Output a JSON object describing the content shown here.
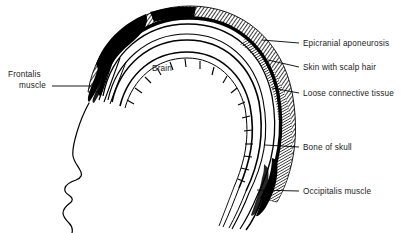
{
  "figure": {
    "background_color": "#ffffff",
    "ink_color": "#000000"
  },
  "interior_labels": [
    {
      "id": "brain",
      "text": "Brain",
      "x": 152,
      "y": 64
    }
  ],
  "labels_right": [
    {
      "id": "epicranial-aponeurosis",
      "text": "Epicranial aponeurosis",
      "text_x": 303,
      "text_y": 39,
      "leader": {
        "x1": 262,
        "y1": 40,
        "x2": 299,
        "y2": 43
      }
    },
    {
      "id": "skin-with-scalp-hair",
      "text": "Skin with scalp hair",
      "text_x": 303,
      "text_y": 63,
      "leader": {
        "x1": 268,
        "y1": 60,
        "x2": 299,
        "y2": 67
      }
    },
    {
      "id": "loose-connective-tissue",
      "text": "Loose connective tissue",
      "text_x": 303,
      "text_y": 89,
      "leader": {
        "x1": 272,
        "y1": 88,
        "x2": 299,
        "y2": 93
      }
    },
    {
      "id": "bone-of-skull",
      "text": "Bone of skull",
      "text_x": 303,
      "text_y": 143,
      "leader": {
        "x1": 265,
        "y1": 145,
        "x2": 299,
        "y2": 147
      }
    },
    {
      "id": "occipitalis-muscle",
      "text": "Occipitalis muscle",
      "text_x": 303,
      "text_y": 187,
      "leader": {
        "x1": 257,
        "y1": 190,
        "x2": 299,
        "y2": 191
      }
    }
  ],
  "labels_left": [
    {
      "id": "frontalis-muscle",
      "line1": "Frontalis",
      "line2": "muscle",
      "line1_x": 8,
      "line1_y": 70,
      "line2_x": 19,
      "line2_y": 81,
      "leader": {
        "x1": 52,
        "y1": 86,
        "x2": 92,
        "y2": 86
      }
    }
  ],
  "anatomy": {
    "layers_outer_to_inner": [
      "Skin with scalp hair",
      "Epicranial aponeurosis",
      "Loose connective tissue",
      "Bone of skull",
      "Brain"
    ],
    "muscles": [
      "Frontalis muscle",
      "Occipitalis muscle"
    ]
  }
}
